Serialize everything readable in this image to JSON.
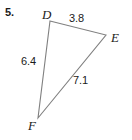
{
  "problem": {
    "number": "5."
  },
  "figure": {
    "type": "triangle",
    "vertices": [
      {
        "name": "D",
        "label": "D",
        "x": 50,
        "y": 21
      },
      {
        "name": "E",
        "label": "E",
        "x": 106,
        "y": 35
      },
      {
        "name": "F",
        "label": "F",
        "x": 38,
        "y": 118
      }
    ],
    "sides": [
      {
        "name": "DE",
        "label": "3.8",
        "from": "D",
        "to": "E"
      },
      {
        "name": "DF",
        "label": "6.4",
        "from": "D",
        "to": "F"
      },
      {
        "name": "EF",
        "label": "7.1",
        "from": "E",
        "to": "F"
      }
    ],
    "stroke_color": "#808080",
    "background_color": "#ffffff",
    "text_color": "#1a1a1a"
  }
}
